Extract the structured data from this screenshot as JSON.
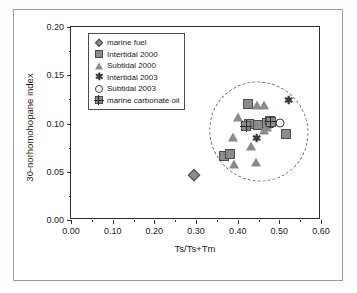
{
  "chart_data": {
    "type": "scatter",
    "title": "",
    "xlabel": "Ts/Ts+Tm",
    "ylabel": "30-norhomohopane index",
    "xlim": [
      0.0,
      0.6
    ],
    "ylim": [
      0.0,
      0.2
    ],
    "xticks": [
      "0.00",
      "0.10",
      "0.20",
      "0.30",
      "0.40",
      "0.50",
      "0.60"
    ],
    "yticks": [
      "0.00",
      "0.05",
      "0.10",
      "0.15",
      "0.20"
    ],
    "xtick_values": [
      0.0,
      0.1,
      0.2,
      0.3,
      0.4,
      0.5,
      0.6
    ],
    "ytick_values": [
      0.0,
      0.05,
      0.1,
      0.15,
      0.2
    ],
    "grid": false,
    "legend_position": "upper-left-inside",
    "annotations": [
      {
        "name": "dashed-envelope-ellipse",
        "shape": "ellipse",
        "style": "dashed",
        "center_x": 0.452,
        "center_y": 0.092,
        "width": 0.235,
        "height": 0.105,
        "rotation_deg": -36
      }
    ],
    "series": [
      {
        "name": "marine fuel",
        "marker": "diamond",
        "fill": "#8b8b8b",
        "points": [
          [
            0.295,
            0.047
          ]
        ]
      },
      {
        "name": "Intertidal 2000",
        "marker": "square",
        "fill": "#8b8b8b",
        "points": [
          [
            0.368,
            0.066
          ],
          [
            0.381,
            0.068
          ],
          [
            0.427,
            0.099
          ],
          [
            0.449,
            0.098
          ],
          [
            0.471,
            0.101
          ],
          [
            0.478,
            0.103
          ],
          [
            0.515,
            0.089
          ],
          [
            0.425,
            0.12
          ]
        ]
      },
      {
        "name": "Subtidal 2000",
        "marker": "triangle",
        "fill": "#8b8b8b",
        "points": [
          [
            0.391,
            0.058
          ],
          [
            0.389,
            0.086
          ],
          [
            0.4,
            0.107
          ],
          [
            0.431,
            0.077
          ],
          [
            0.443,
            0.06
          ],
          [
            0.447,
            0.119
          ],
          [
            0.462,
            0.119
          ],
          [
            0.464,
            0.093
          ],
          [
            0.47,
            0.096
          ]
        ]
      },
      {
        "name": "Intertidal 2003",
        "marker": "asterisk",
        "fill": "#3a3a3a",
        "points": [
          [
            0.444,
            0.084
          ],
          [
            0.477,
            0.101
          ],
          [
            0.482,
            0.1
          ],
          [
            0.523,
            0.123
          ]
        ]
      },
      {
        "name": "Subtidal 2003",
        "marker": "open-circle",
        "fill": "#ffffff",
        "points": [
          [
            0.476,
            0.102
          ],
          [
            0.48,
            0.099
          ],
          [
            0.483,
            0.101
          ],
          [
            0.501,
            0.101
          ]
        ]
      },
      {
        "name": "marine carbonate oil",
        "marker": "crossed-square",
        "fill": "#8b8b8b",
        "points": [
          [
            0.421,
            0.097
          ],
          [
            0.479,
            0.102
          ]
        ]
      }
    ]
  },
  "legend": {
    "items": [
      {
        "label": "marine fuel",
        "marker": "diamond"
      },
      {
        "label": "Intertidal 2000",
        "marker": "square"
      },
      {
        "label": "Subtidal 2000",
        "marker": "triangle"
      },
      {
        "label": "Intertidal 2003",
        "marker": "asterisk"
      },
      {
        "label": "Subtidal 2003",
        "marker": "open-circle"
      },
      {
        "label": "marine carbonate oil",
        "marker": "crossed-square"
      }
    ]
  },
  "colors": {
    "marker_fill": "#8b8b8b",
    "marker_edge": "#4d4d4d",
    "axis": "#2b2b2b",
    "ellipse": "#6f6f6f",
    "background": "#ffffff"
  }
}
